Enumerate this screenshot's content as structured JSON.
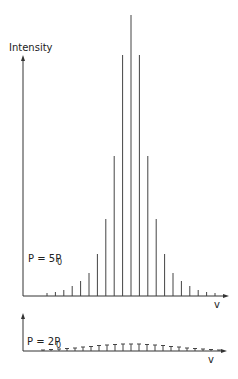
{
  "chart_data": [
    {
      "type": "bar",
      "title": "",
      "ylabel": "Intensity",
      "xlabel": "v",
      "annotation": "P = 5P0",
      "annotation_main": "P = 5P",
      "annotation_sub": "0",
      "grid": false,
      "categories": [
        -10,
        -9,
        -8,
        -7,
        -6,
        -5,
        -4,
        -3,
        -2,
        -1,
        0,
        1,
        2,
        3,
        4,
        5,
        6,
        7,
        8,
        9,
        10
      ],
      "values": [
        3,
        4,
        6,
        10,
        15,
        23,
        42,
        77,
        140,
        241,
        281,
        241,
        140,
        77,
        42,
        23,
        15,
        10,
        6,
        4,
        3
      ],
      "ylim": [
        0,
        290
      ]
    },
    {
      "type": "bar",
      "title": "",
      "ylabel": "",
      "xlabel": "v",
      "annotation": "P = 2P0",
      "annotation_main": "P = 2P",
      "annotation_sub": "0",
      "grid": false,
      "categories": [
        -11,
        -10,
        -9,
        -8,
        -7,
        -6,
        -5,
        -4,
        -3,
        -2,
        -1,
        0,
        1,
        2,
        3,
        4,
        5,
        6,
        7,
        8,
        9,
        10,
        11
      ],
      "values": [
        1,
        1.5,
        2,
        2.5,
        3,
        4,
        4.5,
        5.5,
        6,
        6.5,
        7,
        7,
        7,
        6.5,
        6,
        5.5,
        4.5,
        4,
        3,
        2.5,
        2,
        1.5,
        1
      ],
      "ylim": [
        0,
        290
      ]
    }
  ]
}
